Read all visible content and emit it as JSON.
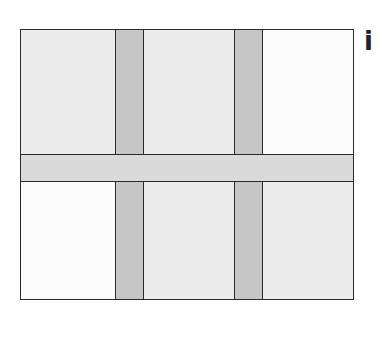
{
  "figure": {
    "label": "i",
    "colors": {
      "border": "#2a2a2a",
      "tile_gray": "#ececec",
      "tile_white": "#fcfcfc",
      "vertical_strip": "#c6c6c6",
      "horizontal_strip": "#dadada"
    },
    "tiles": [
      {
        "row": "top",
        "col": "left",
        "fill": "gray"
      },
      {
        "row": "top",
        "col": "middle",
        "fill": "gray"
      },
      {
        "row": "top",
        "col": "right",
        "fill": "white"
      },
      {
        "row": "bottom",
        "col": "left",
        "fill": "white"
      },
      {
        "row": "bottom",
        "col": "middle",
        "fill": "gray"
      },
      {
        "row": "bottom",
        "col": "right",
        "fill": "gray"
      }
    ]
  }
}
